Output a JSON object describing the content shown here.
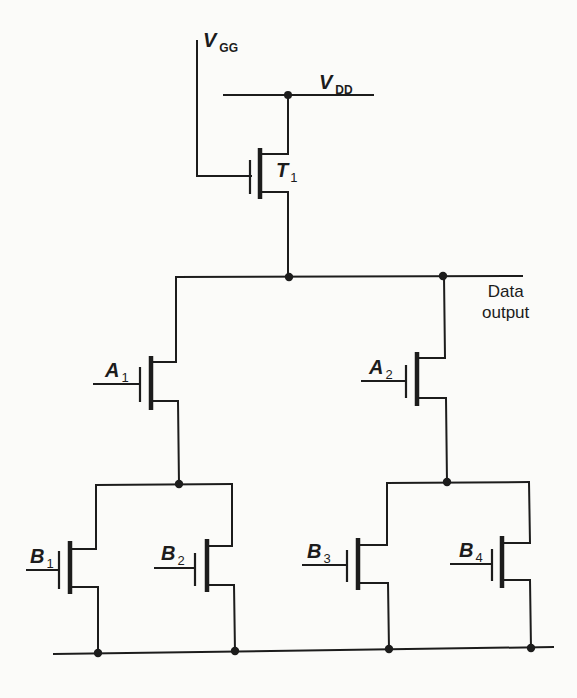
{
  "diagram": {
    "colors": {
      "ink": "#1c1c1c",
      "paper": "#fbfbf9"
    },
    "supplies": {
      "vgg": {
        "main": "V",
        "sub": "GG"
      },
      "vdd": {
        "main": "V",
        "sub": "DD"
      }
    },
    "output": {
      "line1": "Data",
      "line2": "output"
    },
    "transistors": [
      {
        "id": "T1",
        "main": "T",
        "sub": "1",
        "role": "load"
      },
      {
        "id": "A1",
        "main": "A",
        "sub": "1",
        "role": "series-upper-left"
      },
      {
        "id": "A2",
        "main": "A",
        "sub": "2",
        "role": "series-upper-right"
      },
      {
        "id": "B1",
        "main": "B",
        "sub": "1",
        "role": "parallel-lower-left"
      },
      {
        "id": "B2",
        "main": "B",
        "sub": "2",
        "role": "parallel-lower-left"
      },
      {
        "id": "B3",
        "main": "B",
        "sub": "3",
        "role": "parallel-lower-right"
      },
      {
        "id": "B4",
        "main": "B",
        "sub": "4",
        "role": "parallel-lower-right"
      }
    ],
    "nets": [
      "VGG -> T1 gate",
      "VDD -> T1 drain",
      "T1 source -> output node",
      "output node -> A1 drain, A2 drain, Data output",
      "A1 source -> B1 drain, B2 drain",
      "A2 source -> B3 drain, B4 drain",
      "B1..B4 sources -> ground rail"
    ]
  }
}
